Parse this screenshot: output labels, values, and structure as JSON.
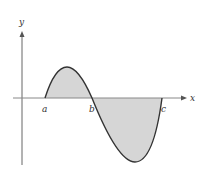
{
  "diagram": {
    "type": "signed-area-under-curve",
    "axes": {
      "x_label": "x",
      "y_label": "y"
    },
    "points": [
      {
        "label": "a",
        "role": "left root"
      },
      {
        "label": "b",
        "role": "middle root"
      },
      {
        "label": "c",
        "role": "right root"
      }
    ],
    "regions": [
      {
        "between": [
          "a",
          "b"
        ],
        "sign": "positive",
        "fill": "#d6d6d6"
      },
      {
        "between": [
          "b",
          "c"
        ],
        "sign": "negative",
        "fill": "#d6d6d6"
      }
    ],
    "colors": {
      "curve": "#333333",
      "axis": "#666666",
      "fill": "#d6d6d6"
    }
  }
}
